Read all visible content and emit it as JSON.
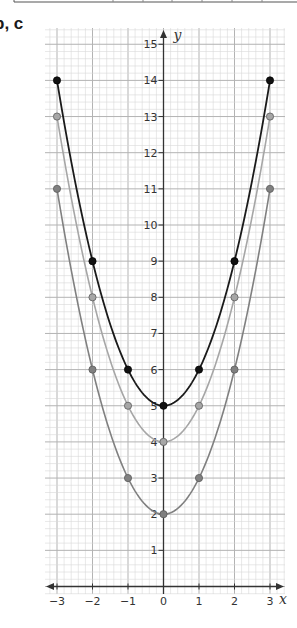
{
  "header": {
    "part_label": "b, c"
  },
  "colors": {
    "curve_b": "#1a1a1a",
    "curve_c1": "#a6a6a6",
    "curve_c2": "#808080",
    "grid_minor": "#d9d9d9",
    "grid_major": "#b3b3b3",
    "axis": "#333333"
  },
  "chart_data": {
    "type": "line",
    "title": "",
    "xlabel": "x",
    "ylabel": "y",
    "xlim": [
      -3.3,
      3.3
    ],
    "ylim": [
      -0.2,
      15.4
    ],
    "x_ticks": [
      -3,
      -2,
      -1,
      0,
      1,
      2,
      3
    ],
    "x_tick_labels": [
      "−3",
      "−2",
      "−1",
      "0",
      "1",
      "2",
      "3"
    ],
    "y_ticks": [
      1,
      2,
      3,
      4,
      5,
      6,
      7,
      8,
      9,
      10,
      11,
      12,
      13,
      14,
      15
    ],
    "y_tick_labels": [
      "1",
      "2",
      "3",
      "4",
      "5",
      "6",
      "7",
      "8",
      "9",
      "10",
      "11",
      "12",
      "13",
      "14",
      "15"
    ],
    "grid": true,
    "minor_grid_per_unit": 5,
    "legend": "none",
    "x": [
      -3,
      -2,
      -1,
      0,
      1,
      2,
      3
    ],
    "series": [
      {
        "name": "y = x² + 5",
        "color_key": "curve_b",
        "values": [
          14,
          9,
          6,
          5,
          6,
          9,
          14
        ],
        "offset": 5
      },
      {
        "name": "y = x² + 4",
        "color_key": "curve_c1",
        "values": [
          13,
          8,
          5,
          4,
          5,
          8,
          13
        ],
        "offset": 4
      },
      {
        "name": "y = x² + 2",
        "color_key": "curve_c2",
        "values": [
          11,
          6,
          3,
          2,
          3,
          6,
          11
        ],
        "offset": 2
      }
    ]
  }
}
